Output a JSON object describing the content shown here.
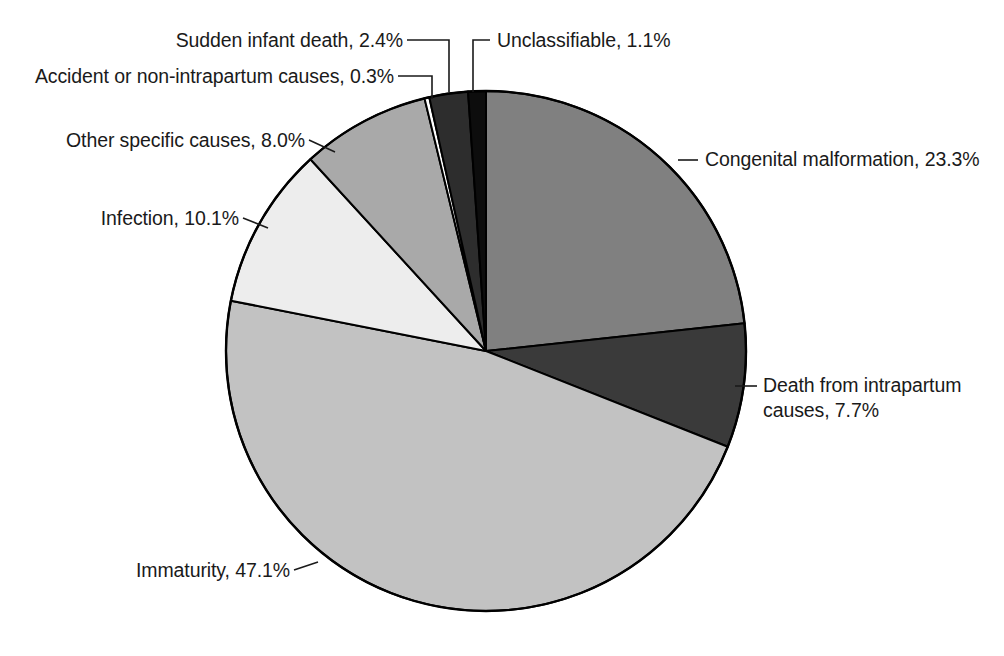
{
  "chart_data": {
    "type": "pie",
    "title": "",
    "subtitle": "",
    "xlabel": "",
    "ylabel": "",
    "legend_position": "none",
    "grid": false,
    "start_angle_deg": 0,
    "direction": "clockwise",
    "units": "percent",
    "categories": [
      "Congenital malformation",
      "Death from intrapartum causes",
      "Immaturity",
      "Infection",
      "Other specific causes",
      "Accident or non-intrapartum causes",
      "Sudden infant death",
      "Unclassifiable"
    ],
    "values": [
      23.3,
      7.7,
      47.1,
      10.1,
      8.0,
      0.3,
      2.4,
      1.1
    ],
    "slices": [
      {
        "label": "Congenital malformation",
        "value": 23.3,
        "value_text": "23.3%",
        "full_label": "Congenital malformation, 23.3%",
        "color": "#808080"
      },
      {
        "label": "Death from intrapartum causes",
        "value": 7.7,
        "value_text": "7.7%",
        "full_label": "Death from intrapartum causes, 7.7%",
        "color": "#3a3a3a"
      },
      {
        "label": "Immaturity",
        "value": 47.1,
        "value_text": "47.1%",
        "full_label": "Immaturity, 47.1%",
        "color": "#c2c2c2"
      },
      {
        "label": "Infection",
        "value": 10.1,
        "value_text": "10.1%",
        "full_label": "Infection, 10.1%",
        "color": "#ededed"
      },
      {
        "label": "Other specific causes",
        "value": 8.0,
        "value_text": "8.0%",
        "full_label": "Other specific causes, 8.0%",
        "color": "#a9a9a9"
      },
      {
        "label": "Accident or non-intrapartum causes",
        "value": 0.3,
        "value_text": "0.3%",
        "full_label": "Accident or non-intrapartum causes, 0.3%",
        "color": "#ffffff"
      },
      {
        "label": "Sudden infant death",
        "value": 2.4,
        "value_text": "2.4%",
        "full_label": "Sudden infant death, 2.4%",
        "color": "#2d2d2d"
      },
      {
        "label": "Unclassifiable",
        "value": 1.1,
        "value_text": "1.1%",
        "full_label": "Unclassifiable, 1.1%",
        "color": "#0d0d0d"
      }
    ]
  },
  "labels": {
    "sudden_infant_death": "Sudden infant death, 2.4%",
    "accident": "Accident or non-intrapartum causes, 0.3%",
    "other_specific": "Other specific causes, 8.0%",
    "infection": "Infection, 10.1%",
    "immaturity": "Immaturity, 47.1%",
    "unclassifiable": "Unclassifiable, 1.1%",
    "congenital": "Congenital malformation, 23.3%",
    "intrapartum_line1": "Death from intrapartum",
    "intrapartum_line2": "causes, 7.7%"
  },
  "colors": {
    "outline": "#000000",
    "background": "#ffffff",
    "leader": "#1a1a1a",
    "text": "#1a1a1a"
  }
}
